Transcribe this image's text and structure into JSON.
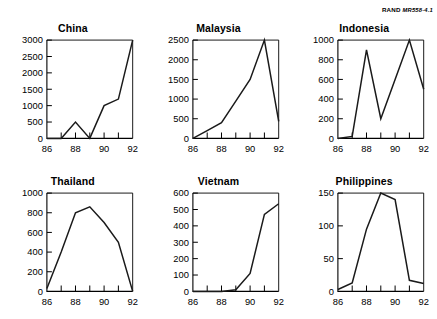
{
  "figure": {
    "source_prefix": "RAND",
    "source_id": "MR558-4.1"
  },
  "chart_data": [
    {
      "type": "line",
      "title": "China",
      "xlabel": "",
      "ylabel": "",
      "x": [
        86,
        87,
        88,
        89,
        90,
        91,
        92
      ],
      "values": [
        0,
        0,
        500,
        0,
        1000,
        1200,
        3000
      ],
      "xlim": [
        86,
        92
      ],
      "ylim": [
        0,
        3000
      ],
      "yticks": [
        0,
        500,
        1000,
        1500,
        2000,
        2500,
        3000
      ],
      "ytick_labels": [
        "0",
        "500",
        "1000",
        "1500",
        "2000",
        "2500",
        "3000"
      ],
      "xticks": [
        86,
        87,
        88,
        89,
        90,
        91,
        92
      ],
      "xtick_labels": [
        "86",
        "",
        "88",
        "",
        "90",
        "",
        "92"
      ],
      "grid": false,
      "legend": "none"
    },
    {
      "type": "line",
      "title": "Malaysia",
      "xlabel": "",
      "ylabel": "",
      "x": [
        86,
        87,
        88,
        89,
        90,
        91,
        92
      ],
      "values": [
        0,
        200,
        400,
        950,
        1500,
        2500,
        430
      ],
      "xlim": [
        86,
        92
      ],
      "ylim": [
        0,
        2500
      ],
      "yticks": [
        0,
        500,
        1000,
        1500,
        2000,
        2500
      ],
      "ytick_labels": [
        "0",
        "500",
        "1000",
        "1500",
        "2000",
        "2500"
      ],
      "xticks": [
        86,
        87,
        88,
        89,
        90,
        91,
        92
      ],
      "xtick_labels": [
        "86",
        "",
        "88",
        "",
        "90",
        "",
        "92"
      ],
      "grid": false,
      "legend": "none"
    },
    {
      "type": "line",
      "title": "Indonesia",
      "xlabel": "",
      "ylabel": "",
      "x": [
        86,
        87,
        88,
        89,
        90,
        91,
        92
      ],
      "values": [
        0,
        20,
        900,
        200,
        600,
        1000,
        500
      ],
      "xlim": [
        86,
        92
      ],
      "ylim": [
        0,
        1000
      ],
      "yticks": [
        0,
        200,
        400,
        600,
        800,
        1000
      ],
      "ytick_labels": [
        "0",
        "200",
        "400",
        "600",
        "800",
        "1000"
      ],
      "xticks": [
        86,
        87,
        88,
        89,
        90,
        91,
        92
      ],
      "xtick_labels": [
        "86",
        "",
        "88",
        "",
        "90",
        "",
        "92"
      ],
      "grid": false,
      "legend": "none"
    },
    {
      "type": "line",
      "title": "Thailand",
      "xlabel": "",
      "ylabel": "",
      "x": [
        86,
        87,
        88,
        89,
        90,
        91,
        92
      ],
      "values": [
        30,
        400,
        800,
        860,
        700,
        500,
        0
      ],
      "xlim": [
        86,
        92
      ],
      "ylim": [
        0,
        1000
      ],
      "yticks": [
        0,
        200,
        400,
        600,
        800,
        1000
      ],
      "ytick_labels": [
        "0",
        "200",
        "400",
        "600",
        "800",
        "1000"
      ],
      "xticks": [
        86,
        87,
        88,
        89,
        90,
        91,
        92
      ],
      "xtick_labels": [
        "86",
        "",
        "88",
        "",
        "90",
        "",
        "92"
      ],
      "grid": false,
      "legend": "none"
    },
    {
      "type": "line",
      "title": "Vietnam",
      "xlabel": "",
      "ylabel": "",
      "x": [
        86,
        87,
        88,
        89,
        90,
        91,
        92
      ],
      "values": [
        0,
        0,
        0,
        10,
        110,
        470,
        535
      ],
      "xlim": [
        86,
        92
      ],
      "ylim": [
        0,
        600
      ],
      "yticks": [
        0,
        100,
        200,
        300,
        400,
        500,
        600
      ],
      "ytick_labels": [
        "0",
        "100",
        "200",
        "300",
        "400",
        "500",
        "600"
      ],
      "xticks": [
        86,
        87,
        88,
        89,
        90,
        91,
        92
      ],
      "xtick_labels": [
        "86",
        "",
        "88",
        "",
        "90",
        "",
        "92"
      ],
      "grid": false,
      "legend": "none"
    },
    {
      "type": "line",
      "title": "Philippines",
      "xlabel": "",
      "ylabel": "",
      "x": [
        86,
        87,
        88,
        89,
        90,
        91,
        92
      ],
      "values": [
        3,
        13,
        95,
        150,
        140,
        17,
        12
      ],
      "xlim": [
        86,
        92
      ],
      "ylim": [
        0,
        150
      ],
      "yticks": [
        0,
        50,
        100,
        150
      ],
      "ytick_labels": [
        "0",
        "50",
        "100",
        "150"
      ],
      "xticks": [
        86,
        87,
        88,
        89,
        90,
        91,
        92
      ],
      "xtick_labels": [
        "86",
        "",
        "88",
        "",
        "90",
        "",
        "92"
      ],
      "grid": false,
      "legend": "none"
    }
  ]
}
